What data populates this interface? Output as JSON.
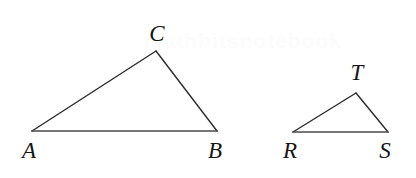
{
  "figure": {
    "background_color": "#ffffff",
    "stroke_color": "#2b2b2b",
    "base_stroke_color": "#4a4a4a",
    "label_color": "#151515",
    "width": 416,
    "height": 178
  },
  "watermark": {
    "text": "mathbitsnotebook",
    "color": "#fcfcfd"
  },
  "chart_data": {
    "type": "diagram",
    "subtype": "geometry-similar-triangles",
    "shapes": [
      {
        "name": "triangle-abc",
        "label": "ABC",
        "vertices": [
          {
            "label": "A",
            "x": 32,
            "y": 131,
            "label_x": 29,
            "label_y": 158
          },
          {
            "label": "B",
            "x": 217,
            "y": 131,
            "label_x": 215,
            "label_y": 158
          },
          {
            "label": "C",
            "x": 156,
            "y": 51,
            "label_x": 157,
            "label_y": 41
          }
        ],
        "edges": [
          {
            "from": "A",
            "to": "C"
          },
          {
            "from": "C",
            "to": "B"
          },
          {
            "from": "A",
            "to": "B",
            "is_base": true
          }
        ]
      },
      {
        "name": "triangle-rst",
        "label": "RST",
        "vertices": [
          {
            "label": "R",
            "x": 293,
            "y": 132,
            "label_x": 290,
            "label_y": 158
          },
          {
            "label": "S",
            "x": 388,
            "y": 132,
            "label_x": 385,
            "label_y": 158
          },
          {
            "label": "T",
            "x": 356,
            "y": 93,
            "label_x": 357,
            "label_y": 80
          }
        ],
        "edges": [
          {
            "from": "R",
            "to": "T"
          },
          {
            "from": "T",
            "to": "S"
          },
          {
            "from": "R",
            "to": "S",
            "is_base": true
          }
        ]
      }
    ]
  }
}
